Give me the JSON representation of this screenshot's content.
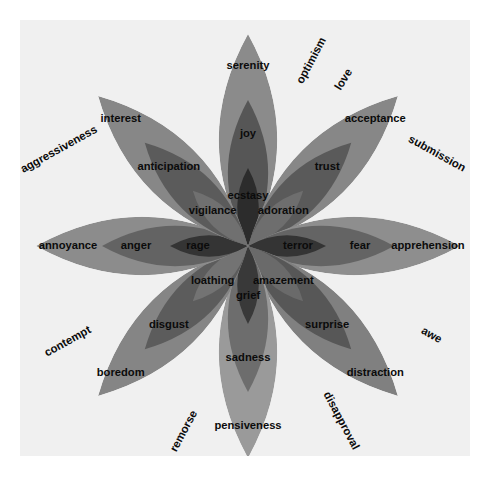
{
  "figure": {
    "background_color": "#f0f0f0",
    "page_background": "#ffffff",
    "text_color": "#0b0b0b"
  },
  "chart_data": {
    "type": "pie",
    "legend": "none",
    "grid": false,
    "center": {
      "x": 228,
      "y": 226
    },
    "petal_count": 8,
    "rings": [
      "outer (mild)",
      "middle (basic)",
      "inner (intense)"
    ],
    "petals": [
      {
        "angle_deg": 270,
        "direction": "up",
        "outer": {
          "label": "serenity",
          "color": "#8b8b8b"
        },
        "middle": {
          "label": "joy",
          "color": "#565656"
        },
        "inner": {
          "label": "ecstasy",
          "color": "#2c2c2c"
        }
      },
      {
        "angle_deg": 315,
        "direction": "up-right",
        "outer": {
          "label": "acceptance",
          "color": "#878787"
        },
        "middle": {
          "label": "trust",
          "color": "#5a5a5a"
        },
        "inner": {
          "label": "adoration",
          "color": "#6e6e6e"
        }
      },
      {
        "angle_deg": 0,
        "direction": "right",
        "outer": {
          "label": "apprehension",
          "color": "#8e8e8e"
        },
        "middle": {
          "label": "fear",
          "color": "#646464"
        },
        "inner": {
          "label": "terror",
          "color": "#343434"
        }
      },
      {
        "angle_deg": 45,
        "direction": "down-right",
        "outer": {
          "label": "distraction",
          "color": "#808080"
        },
        "middle": {
          "label": "surprise",
          "color": "#575757"
        },
        "inner": {
          "label": "amazement",
          "color": "#6a6a6a"
        }
      },
      {
        "angle_deg": 90,
        "direction": "down",
        "outer": {
          "label": "pensiveness",
          "color": "#9a9a9a"
        },
        "middle": {
          "label": "sadness",
          "color": "#6d6d6d"
        },
        "inner": {
          "label": "grief",
          "color": "#393939"
        }
      },
      {
        "angle_deg": 135,
        "direction": "down-left",
        "outer": {
          "label": "boredom",
          "color": "#858585"
        },
        "middle": {
          "label": "disgust",
          "color": "#5c5c5c"
        },
        "inner": {
          "label": "loathing",
          "color": "#737373"
        }
      },
      {
        "angle_deg": 180,
        "direction": "left",
        "outer": {
          "label": "annoyance",
          "color": "#8c8c8c"
        },
        "middle": {
          "label": "anger",
          "color": "#636363"
        },
        "inner": {
          "label": "rage",
          "color": "#343434"
        }
      },
      {
        "angle_deg": 225,
        "direction": "up-left",
        "outer": {
          "label": "interest",
          "color": "#878787"
        },
        "middle": {
          "label": "anticipation",
          "color": "#5b5b5b"
        },
        "inner": {
          "label": "vigilance",
          "color": "#707070"
        }
      }
    ],
    "dyads": [
      {
        "label": "optimism",
        "angle_deg": 292.5,
        "rotation_deg": -62
      },
      {
        "label": "love",
        "angle_deg": 292.5,
        "rotation_deg": -62,
        "slot": "love"
      },
      {
        "label": "submission",
        "angle_deg": 337.5,
        "rotation_deg": 28
      },
      {
        "label": "awe",
        "angle_deg": 22.5,
        "rotation_deg": 28
      },
      {
        "label": "disapproval",
        "angle_deg": 67.5,
        "rotation_deg": 62
      },
      {
        "label": "remorse",
        "angle_deg": 112.5,
        "rotation_deg": -62
      },
      {
        "label": "contempt",
        "angle_deg": 157.5,
        "rotation_deg": -28
      },
      {
        "label": "aggressiveness",
        "angle_deg": 202.5,
        "rotation_deg": -28
      }
    ]
  },
  "labels": {
    "serenity": "serenity",
    "joy": "joy",
    "ecstasy": "ecstasy",
    "acceptance": "acceptance",
    "trust": "trust",
    "adoration": "adoration",
    "apprehension": "apprehension",
    "fear": "fear",
    "terror": "terror",
    "distraction": "distraction",
    "surprise": "surprise",
    "amazement": "amazement",
    "pensiveness": "pensiveness",
    "sadness": "sadness",
    "grief": "grief",
    "boredom": "boredom",
    "disgust": "disgust",
    "loathing": "loathing",
    "annoyance": "annoyance",
    "anger": "anger",
    "rage": "rage",
    "interest": "interest",
    "anticipation": "anticipation",
    "vigilance": "vigilance",
    "optimism": "optimism",
    "love": "love",
    "submission": "submission",
    "awe": "awe",
    "disapproval": "disapproval",
    "remorse": "remorse",
    "contempt": "contempt",
    "aggressiveness": "aggressiveness"
  }
}
